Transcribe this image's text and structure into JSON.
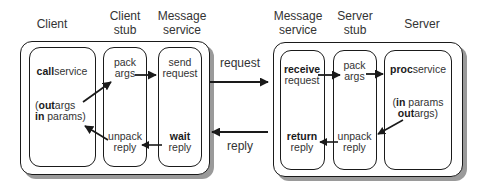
{
  "diagram": {
    "title": "",
    "client_side": {
      "headers": {
        "client": "Client",
        "client_stub_1": "Client",
        "client_stub_2": "stub",
        "message_service_1": "Message",
        "message_service_2": "service"
      },
      "client_box": {
        "call_bold": "call",
        "call_rest": "service",
        "params_line1_open": "(",
        "params_line1_bold": "out",
        "params_line1_rest": "args",
        "params_line2_bold": "in",
        "params_line2_rest": " params)"
      },
      "client_stub_box": {
        "pack_1": "pack",
        "pack_2": "args",
        "unpack_1": "unpack",
        "unpack_2": "reply"
      },
      "message_service_box": {
        "send_1": "send",
        "send_2": "request",
        "wait_bold": "wait",
        "wait_2": "reply"
      }
    },
    "network": {
      "request_label": "request",
      "reply_label": "reply"
    },
    "server_side": {
      "headers": {
        "message_service_1": "Message",
        "message_service_2": "service",
        "server_stub_1": "Server",
        "server_stub_2": "stub",
        "server": "Server"
      },
      "message_service_box": {
        "receive_bold": "receive",
        "receive_2": "request",
        "return_bold": "return",
        "return_2": "reply"
      },
      "server_stub_box": {
        "pack_1": "pack",
        "pack_2": "args",
        "unpack_1": "unpack",
        "unpack_2": "reply"
      },
      "server_box": {
        "proc_bold": "proc",
        "proc_rest": "service",
        "params_line1_open": "(",
        "params_line1_bold": "in",
        "params_line1_rest": " params",
        "params_line2_bold": "out",
        "params_line2_rest": "args)"
      }
    },
    "colors": {
      "stroke": "#1a1a1a",
      "shadow": "#9a9a9a",
      "text": "#333333"
    }
  }
}
